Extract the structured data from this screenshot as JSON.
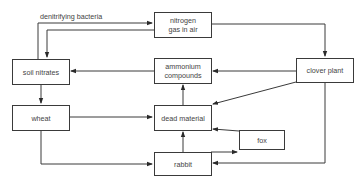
{
  "diagram": {
    "type": "flowchart",
    "title": "",
    "nodes": [
      {
        "id": "nitrogen",
        "label_line1": "nitrogen",
        "label_line2": "gas in air"
      },
      {
        "id": "soil_nitrates",
        "label": "soil nitrates"
      },
      {
        "id": "ammonium",
        "label_line1": "ammonium",
        "label_line2": "compounds"
      },
      {
        "id": "clover",
        "label": "clover plant"
      },
      {
        "id": "wheat",
        "label": "wheat"
      },
      {
        "id": "dead_material",
        "label": "dead material"
      },
      {
        "id": "fox",
        "label": "fox"
      },
      {
        "id": "rabbit",
        "label": "rabbit"
      }
    ],
    "edges": [
      {
        "from": "soil_nitrates",
        "to": "nitrogen",
        "label": "denitrifying bacteria"
      },
      {
        "from": "nitrogen",
        "to": "soil_nitrates"
      },
      {
        "from": "nitrogen",
        "to": "clover"
      },
      {
        "from": "ammonium",
        "to": "soil_nitrates"
      },
      {
        "from": "clover",
        "to": "ammonium"
      },
      {
        "from": "clover",
        "to": "dead_material"
      },
      {
        "from": "clover",
        "to": "rabbit"
      },
      {
        "from": "soil_nitrates",
        "to": "wheat"
      },
      {
        "from": "wheat",
        "to": "dead_material"
      },
      {
        "from": "wheat",
        "to": "rabbit"
      },
      {
        "from": "dead_material",
        "to": "ammonium"
      },
      {
        "from": "rabbit",
        "to": "dead_material"
      },
      {
        "from": "rabbit",
        "to": "fox"
      },
      {
        "from": "fox",
        "to": "dead_material"
      }
    ],
    "edge_label": "denitrifying bacteria",
    "line_color": "#3a3a3a"
  }
}
